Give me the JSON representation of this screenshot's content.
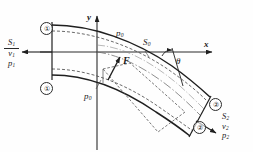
{
  "figure": {
    "type": "fluid-mechanics-pipe-bend-diagram"
  },
  "axes": {
    "y_label": "y",
    "x_label": "x",
    "origin_px": [
      97,
      52
    ],
    "x_axis_end_px": [
      217,
      52
    ],
    "y_axis_top_px": [
      97,
      12
    ]
  },
  "section_markers": [
    {
      "name": "inlet-upper",
      "text": "①",
      "x": 40,
      "y": 22
    },
    {
      "name": "inlet-lower",
      "text": "①",
      "x": 40,
      "y": 82
    },
    {
      "name": "outlet-upper",
      "text": "②",
      "x": 209,
      "y": 98
    },
    {
      "name": "outlet-lower",
      "text": "②",
      "x": 193,
      "y": 121
    }
  ],
  "inlet": {
    "area": {
      "base": "S",
      "sub": "1"
    },
    "velocity": {
      "base": "v",
      "sub": "1"
    },
    "pressure": {
      "base": "p",
      "sub": "1"
    },
    "arrow_direction": "left"
  },
  "outlet": {
    "area": {
      "base": "S",
      "sub": "2"
    },
    "velocity": {
      "base": "v",
      "sub": "2"
    },
    "pressure": {
      "base": "p",
      "sub": "2"
    },
    "arrow_direction": "down-right"
  },
  "wall_labels": [
    {
      "name": "ambient-pressure-upper",
      "base": "p",
      "sub": "0",
      "x": 116,
      "y": 29
    },
    {
      "name": "ambient-pressure-lower",
      "base": "p",
      "sub": "0",
      "x": 84,
      "y": 92
    },
    {
      "name": "reference-area",
      "base": "S",
      "sub": "0",
      "x": 143,
      "y": 44
    }
  ],
  "force": {
    "label": "F",
    "x": 122,
    "y": 57,
    "tail_px": [
      108,
      79
    ],
    "head_px": [
      119,
      58
    ]
  },
  "angle": {
    "label": "θ",
    "x": 177,
    "y": 57,
    "vertex_px": [
      168,
      52
    ]
  },
  "colors": {
    "ink": "#1a1a1a",
    "line": "#2b2b2b",
    "dash": "#555555",
    "thin": "#777777",
    "background": "#fefefe"
  }
}
